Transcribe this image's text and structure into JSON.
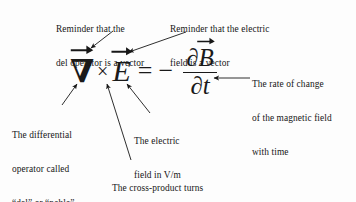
{
  "figure": {
    "background_color": "#fdfdfd",
    "ink_color": "#171717"
  },
  "equation": {
    "plain": "∇ × E = − ∂B/∂t",
    "nabla": "∇",
    "cross": "×",
    "e_field": "E",
    "equals": "=",
    "minus": "−",
    "partial_numerator": "∂",
    "b_field": "B",
    "partial_denominator": "∂",
    "time": "t"
  },
  "annotations": [
    {
      "id": "nabla-vector-note",
      "name": "reminder-del-is-vector",
      "lines": [
        "Reminder that the",
        "del operator is a vector"
      ],
      "position": "top-left"
    },
    {
      "id": "e-vector-note",
      "name": "reminder-e-is-vector",
      "lines": [
        "Reminder that the electric",
        "field is a vector"
      ],
      "position": "top-right"
    },
    {
      "id": "rate-of-change-note",
      "name": "rate-of-change-of-b",
      "lines": [
        "The rate of change",
        "of the magnetic field",
        "with time"
      ],
      "position": "right"
    },
    {
      "id": "del-operator-note",
      "name": "differential-operator-del",
      "lines": [
        "The differential",
        "operator called",
        "“del” or “nabla”"
      ],
      "position": "bottom-left"
    },
    {
      "id": "e-field-units-note",
      "name": "electric-field-units",
      "lines": [
        "The electric",
        "field in V/m"
      ],
      "position": "bottom-center-right"
    },
    {
      "id": "cross-product-note",
      "name": "cross-product-curl",
      "lines": [
        "The cross-product turns",
        "the del operator into the",
        "curl"
      ],
      "position": "bottom-center"
    }
  ]
}
